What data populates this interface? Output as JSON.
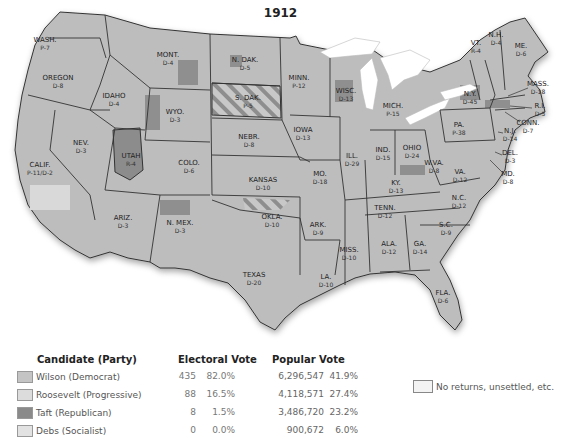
{
  "title": "1912",
  "colors": {
    "wilson": "#c4c4c4",
    "roosevelt": "#dcdcdc",
    "taft": "#8a8a8a",
    "debs": "#e2e2e2",
    "no_returns": "#f3f3f3"
  },
  "states": [
    {
      "name": "WASH.",
      "vote": "P-7",
      "x": 45,
      "y": 42
    },
    {
      "name": "OREGON",
      "vote": "D-8",
      "x": 58,
      "y": 80
    },
    {
      "name": "IDAHO",
      "vote": "D-4",
      "x": 114,
      "y": 98
    },
    {
      "name": "MONT.",
      "vote": "D-4",
      "x": 168,
      "y": 57
    },
    {
      "name": "WYO.",
      "vote": "D-3",
      "x": 175,
      "y": 114
    },
    {
      "name": "NEV.",
      "vote": "D-3",
      "x": 81,
      "y": 145
    },
    {
      "name": "UTAH",
      "vote": "R-4",
      "x": 131,
      "y": 158
    },
    {
      "name": "CALIF.",
      "vote": "P-11/D-2",
      "x": 40,
      "y": 167
    },
    {
      "name": "COLO.",
      "vote": "D-6",
      "x": 189,
      "y": 165
    },
    {
      "name": "ARIZ.",
      "vote": "D-3",
      "x": 123,
      "y": 220
    },
    {
      "name": "N. MEX.",
      "vote": "D-3",
      "x": 180,
      "y": 225
    },
    {
      "name": "N. DAK.",
      "vote": "D-5",
      "x": 245,
      "y": 62
    },
    {
      "name": "S. DAK.",
      "vote": "P-5",
      "x": 248,
      "y": 100
    },
    {
      "name": "NEBR.",
      "vote": "D-8",
      "x": 249,
      "y": 139
    },
    {
      "name": "KANSAS",
      "vote": "D-10",
      "x": 263,
      "y": 182
    },
    {
      "name": "OKLA.",
      "vote": "D-10",
      "x": 272,
      "y": 219
    },
    {
      "name": "TEXAS",
      "vote": "D-20",
      "x": 254,
      "y": 277
    },
    {
      "name": "MINN.",
      "vote": "P-12",
      "x": 299,
      "y": 80
    },
    {
      "name": "IOWA",
      "vote": "D-13",
      "x": 303,
      "y": 132
    },
    {
      "name": "MO.",
      "vote": "D-18",
      "x": 320,
      "y": 176
    },
    {
      "name": "ARK.",
      "vote": "D-9",
      "x": 318,
      "y": 227
    },
    {
      "name": "LA.",
      "vote": "D-10",
      "x": 326,
      "y": 279
    },
    {
      "name": "WISC.",
      "vote": "D-13",
      "x": 346,
      "y": 93
    },
    {
      "name": "ILL.",
      "vote": "D-29",
      "x": 352,
      "y": 158
    },
    {
      "name": "MISS.",
      "vote": "D-10",
      "x": 349,
      "y": 252
    },
    {
      "name": "MICH.",
      "vote": "P-15",
      "x": 393,
      "y": 108
    },
    {
      "name": "IND.",
      "vote": "D-15",
      "x": 383,
      "y": 152
    },
    {
      "name": "KY.",
      "vote": "D-13",
      "x": 396,
      "y": 185
    },
    {
      "name": "TENN.",
      "vote": "D-12",
      "x": 385,
      "y": 210
    },
    {
      "name": "ALA.",
      "vote": "D-12",
      "x": 389,
      "y": 246
    },
    {
      "name": "OHIO",
      "vote": "D-24",
      "x": 412,
      "y": 150
    },
    {
      "name": "W.VA.",
      "vote": "D-8",
      "x": 434,
      "y": 165
    },
    {
      "name": "VA.",
      "vote": "D-12",
      "x": 460,
      "y": 174
    },
    {
      "name": "N.C.",
      "vote": "D-12",
      "x": 459,
      "y": 200
    },
    {
      "name": "S.C.",
      "vote": "D-9",
      "x": 446,
      "y": 227
    },
    {
      "name": "GA.",
      "vote": "D-14",
      "x": 420,
      "y": 246
    },
    {
      "name": "FLA.",
      "vote": "D-6",
      "x": 443,
      "y": 295
    },
    {
      "name": "PA.",
      "vote": "P-38",
      "x": 459,
      "y": 127
    },
    {
      "name": "N.Y.",
      "vote": "D-45",
      "x": 470,
      "y": 96
    },
    {
      "name": "VT.",
      "vote": "R-4",
      "x": 476,
      "y": 45
    },
    {
      "name": "N.H.",
      "vote": "D-4",
      "x": 496,
      "y": 37
    },
    {
      "name": "ME.",
      "vote": "D-6",
      "x": 521,
      "y": 48
    },
    {
      "name": "MASS.",
      "vote": "D-18",
      "x": 538,
      "y": 86
    },
    {
      "name": "R.I.",
      "vote": "D-5",
      "x": 540,
      "y": 108
    },
    {
      "name": "CONN.",
      "vote": "D-7",
      "x": 528,
      "y": 125
    },
    {
      "name": "N.J.",
      "vote": "D-14",
      "x": 510,
      "y": 133
    },
    {
      "name": "DEL.",
      "vote": "D-3",
      "x": 510,
      "y": 155
    },
    {
      "name": "MD.",
      "vote": "D-8",
      "x": 508,
      "y": 176
    }
  ],
  "legend": {
    "headers": {
      "candidate": "Candidate (Party)",
      "electoral": "Electoral Vote",
      "popular": "Popular Vote"
    },
    "rows": [
      {
        "candidate": "Wilson (Democrat)",
        "ev": "435",
        "ev_pct": "82.0%",
        "pv": "6,296,547",
        "pv_pct": "41.9%",
        "swatch": "#c4c4c4"
      },
      {
        "candidate": "Roosevelt (Progressive)",
        "ev": "88",
        "ev_pct": "16.5%",
        "pv": "4,118,571",
        "pv_pct": "27.4%",
        "swatch": "#dcdcdc"
      },
      {
        "candidate": "Taft (Republican)",
        "ev": "8",
        "ev_pct": "1.5%",
        "pv": "3,486,720",
        "pv_pct": "23.2%",
        "swatch": "#8a8a8a"
      },
      {
        "candidate": "Debs (Socialist)",
        "ev": "0",
        "ev_pct": "0.0%",
        "pv": "900,672",
        "pv_pct": "6.0%",
        "swatch": "#e2e2e2"
      }
    ],
    "no_returns": "No returns, unsettled, etc."
  }
}
